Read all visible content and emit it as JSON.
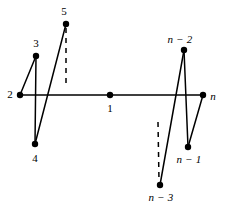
{
  "figure": {
    "type": "graph-diagram",
    "width": 225,
    "height": 205,
    "background_color": "#ffffff",
    "stroke_color": "#000000",
    "node_fill_color": "#000000"
  },
  "nodes": [
    {
      "id": "n1",
      "label": "1",
      "italic": false,
      "x": 110,
      "y": 95,
      "radius": 3.2,
      "label_x": 110,
      "label_y": 108
    },
    {
      "id": "n2",
      "label": "2",
      "italic": false,
      "x": 20,
      "y": 95,
      "radius": 3.2,
      "label_x": 10,
      "label_y": 94
    },
    {
      "id": "n3",
      "label": "3",
      "italic": false,
      "x": 36,
      "y": 56,
      "radius": 3.2,
      "label_x": 36,
      "label_y": 43
    },
    {
      "id": "n4",
      "label": "4",
      "italic": false,
      "x": 35,
      "y": 144,
      "radius": 3.2,
      "label_x": 35,
      "label_y": 158
    },
    {
      "id": "n5",
      "label": "5",
      "italic": false,
      "x": 66,
      "y": 24,
      "radius": 3.2,
      "label_x": 64,
      "label_y": 11
    },
    {
      "id": "nm2",
      "label": "n − 2",
      "italic": true,
      "x": 184,
      "y": 50,
      "radius": 3.2,
      "label_x": 180,
      "label_y": 39
    },
    {
      "id": "nm1",
      "label": "n − 1",
      "italic": true,
      "x": 188,
      "y": 147,
      "radius": 3.2,
      "label_x": 189,
      "label_y": 159
    },
    {
      "id": "nm3",
      "label": "n − 3",
      "italic": true,
      "x": 160,
      "y": 185,
      "radius": 3.2,
      "label_x": 161,
      "label_y": 197
    },
    {
      "id": "nn",
      "label": "n",
      "italic": true,
      "x": 203,
      "y": 95,
      "radius": 3.2,
      "label_x": 213,
      "label_y": 96
    }
  ],
  "edges": [
    {
      "id": "e-2-n",
      "from": "n2",
      "to": "nn",
      "x1": 20,
      "y1": 95,
      "x2": 203,
      "y2": 95,
      "style": "solid",
      "width": 1.5
    },
    {
      "id": "e-2-3",
      "from": "n2",
      "to": "n3",
      "x1": 20,
      "y1": 95,
      "x2": 36,
      "y2": 56,
      "style": "solid",
      "width": 1.5
    },
    {
      "id": "e-3-4",
      "from": "n3",
      "to": "n4",
      "x1": 36,
      "y1": 56,
      "x2": 35,
      "y2": 144,
      "style": "solid",
      "width": 1.5
    },
    {
      "id": "e-4-5",
      "from": "n4",
      "to": "n5",
      "x1": 35,
      "y1": 144,
      "x2": 66,
      "y2": 24,
      "style": "solid",
      "width": 1.5
    },
    {
      "id": "e-nm3-nm2",
      "from": "nm3",
      "to": "nm2",
      "x1": 160,
      "y1": 185,
      "x2": 184,
      "y2": 50,
      "style": "solid",
      "width": 1.5
    },
    {
      "id": "e-nm2-nm1",
      "from": "nm2",
      "to": "nm1",
      "x1": 184,
      "y1": 50,
      "x2": 188,
      "y2": 147,
      "style": "solid",
      "width": 1.5
    },
    {
      "id": "e-nm1-n",
      "from": "nm1",
      "to": "nn",
      "x1": 188,
      "y1": 147,
      "x2": 203,
      "y2": 95,
      "style": "solid",
      "width": 1.5
    }
  ],
  "continuation_marks": [
    {
      "id": "dash-left",
      "x1": 66,
      "y1": 28,
      "x2": 66,
      "y2": 83,
      "style": "dashed",
      "width": 1.5,
      "dash_pattern": "5,5"
    },
    {
      "id": "dash-right",
      "x1": 158,
      "y1": 122,
      "x2": 159,
      "y2": 181,
      "style": "dashed",
      "width": 1.5,
      "dash_pattern": "5,5"
    }
  ]
}
